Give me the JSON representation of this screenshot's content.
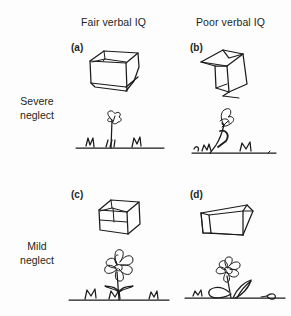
{
  "figure": {
    "columns": [
      {
        "id": "fair",
        "label": "Fair verbal IQ"
      },
      {
        "id": "poor",
        "label": "Poor verbal IQ"
      }
    ],
    "rows": [
      {
        "id": "severe",
        "line1": "Severe",
        "line2": "neglect"
      },
      {
        "id": "mild",
        "line1": "Mild",
        "line2": "neglect"
      }
    ],
    "panels": [
      {
        "id": "a",
        "letter": "(a)",
        "row": "severe",
        "column": "fair",
        "drawings": [
          "cube",
          "flower"
        ]
      },
      {
        "id": "b",
        "letter": "(b)",
        "row": "severe",
        "column": "poor",
        "drawings": [
          "cube",
          "flower"
        ]
      },
      {
        "id": "c",
        "letter": "(c)",
        "row": "mild",
        "column": "fair",
        "drawings": [
          "cube",
          "flower"
        ]
      },
      {
        "id": "d",
        "letter": "(d)",
        "row": "mild",
        "column": "poor",
        "drawings": [
          "cube",
          "flower"
        ]
      }
    ],
    "ink_color": "#1c1a1a",
    "background_color": "#fdfdfd"
  }
}
